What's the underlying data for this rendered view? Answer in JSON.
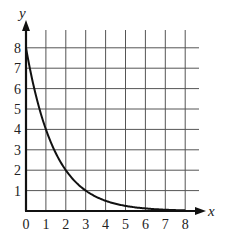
{
  "chart_data": {
    "type": "line",
    "title": "",
    "xlabel": "x",
    "ylabel": "y",
    "xlim": [
      0,
      8
    ],
    "ylim": [
      0,
      8
    ],
    "grid": true,
    "legend": null,
    "x_ticks": [
      "0",
      "1",
      "2",
      "3",
      "4",
      "5",
      "6",
      "7",
      "8"
    ],
    "y_ticks": [
      "1",
      "2",
      "3",
      "4",
      "5",
      "6",
      "7",
      "8"
    ],
    "series": [
      {
        "name": "y = 8(1/2)^x",
        "x": [
          0,
          1,
          2,
          3,
          4,
          5,
          6,
          7,
          8
        ],
        "y": [
          8,
          4,
          2,
          1,
          0.5,
          0.25,
          0.125,
          0.0625,
          0.03125
        ]
      }
    ],
    "colors": {
      "grid": "#555555",
      "axis": "#111111",
      "curve": "#111111"
    }
  }
}
